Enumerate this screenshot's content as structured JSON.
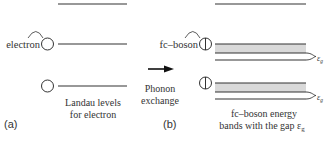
{
  "panel_a": {
    "label": "(a)",
    "particle_label": "electron",
    "caption_line1": "Landau levels",
    "caption_line2": "for electron"
  },
  "arrow": {
    "label_line1": "Phonon",
    "label_line2": "exchange"
  },
  "panel_b": {
    "label": "(b)",
    "particle_label": "fc–boson",
    "caption_line1": "fc–boson energy",
    "caption_line2": "bands with the gap ε",
    "caption_subscript": "g",
    "gap_symbol": "ε",
    "gap_subscript": "g"
  },
  "colors": {
    "line": "#333333",
    "band_fill": "#d9d9d9"
  }
}
